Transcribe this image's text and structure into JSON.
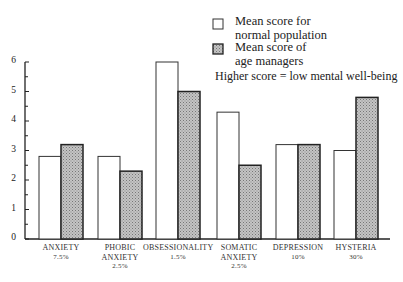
{
  "chart_data": {
    "type": "bar",
    "title": "",
    "xlabel": "",
    "ylabel": "",
    "ylim": [
      0,
      6
    ],
    "yticks": [
      0,
      1,
      2,
      3,
      4,
      5,
      6
    ],
    "grid": false,
    "legend_position": "top-right",
    "categories": [
      "ANXIETY",
      "PHOBIC ANXIETY",
      "OBSESSIONALITY",
      "SOMATIC ANXIETY",
      "DEPRESSION",
      "HYSTERIA"
    ],
    "category_labels": [
      {
        "lines": [
          "ANXIETY",
          "7.5%"
        ]
      },
      {
        "lines": [
          "PHOBIC",
          "ANXIETY",
          "2.5%"
        ]
      },
      {
        "lines": [
          "OBSESSIONALITY",
          "1.5%"
        ]
      },
      {
        "lines": [
          "SOMATIC",
          "ANXIETY",
          "2.5%"
        ]
      },
      {
        "lines": [
          "DEPRESSION",
          "10%"
        ]
      },
      {
        "lines": [
          "HYSTERIA",
          "30%"
        ]
      }
    ],
    "series": [
      {
        "name": "Mean score for normal population",
        "fill": "#ffffff",
        "values": [
          2.8,
          2.8,
          6.0,
          4.3,
          3.2,
          3.0
        ]
      },
      {
        "name": "Mean score of age managers",
        "fill": "#b8b8b8",
        "values": [
          3.2,
          2.3,
          5.0,
          2.5,
          3.2,
          4.8
        ]
      }
    ],
    "annotations": [
      "Higher score = low mental well-being"
    ]
  },
  "legend": {
    "normal_line1": "Mean score for",
    "normal_line2": "normal population",
    "managers_line1": "Mean score of",
    "managers_line2": "age managers",
    "note": "Higher score = low mental well-being"
  }
}
